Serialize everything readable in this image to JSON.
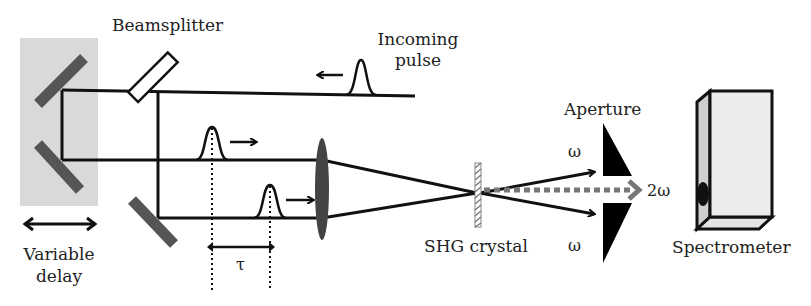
{
  "diagram": {
    "type": "optical-setup",
    "labels": {
      "beamsplitter": "Beamsplitter",
      "incoming_pulse_line1": "Incoming",
      "incoming_pulse_line2": "pulse",
      "aperture": "Aperture",
      "omega_upper": "ω",
      "omega_lower": "ω",
      "two_omega": "2ω",
      "shg_crystal": "SHG crystal",
      "spectrometer": "Spectrometer",
      "variable_delay_line1": "Variable",
      "variable_delay_line2": "delay",
      "tau": "τ"
    },
    "components": [
      "variable-delay-stage",
      "delay-mirror-upper",
      "delay-mirror-lower",
      "beamsplitter",
      "fold-mirror",
      "focusing-lens",
      "shg-crystal",
      "aperture-upper",
      "aperture-lower",
      "spectrometer"
    ],
    "colors": {
      "beam": "#111111",
      "mirror": "#555555",
      "delay_stage": "#d9d9d9",
      "lens": "#444444",
      "second_harmonic": "#777777",
      "aperture": "#000000",
      "spectrometer_face": "#ececec"
    }
  }
}
